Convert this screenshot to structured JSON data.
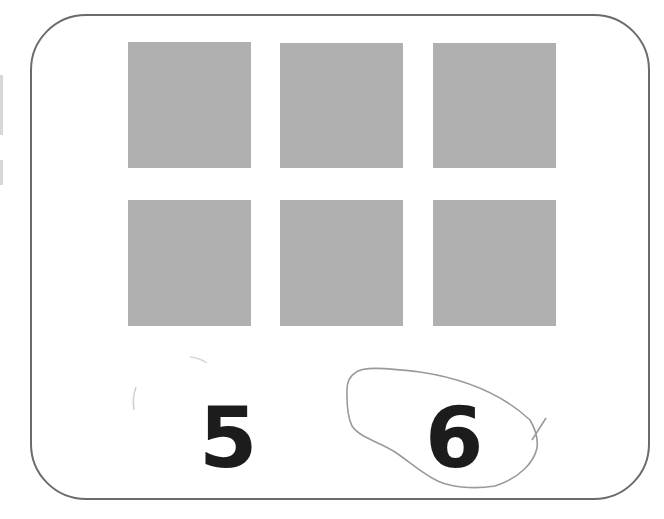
{
  "card": {
    "border_color": "#6b6b6b",
    "background": "#ffffff"
  },
  "squares": {
    "color": "#b0b0b0",
    "rows": 2,
    "columns": 3,
    "count": 6
  },
  "choices": [
    {
      "label": "5",
      "circled": false
    },
    {
      "label": "6",
      "circled": true
    }
  ],
  "annotation": {
    "type": "hand-drawn circle",
    "around_choice": "6",
    "color": "#9a9a9a"
  }
}
